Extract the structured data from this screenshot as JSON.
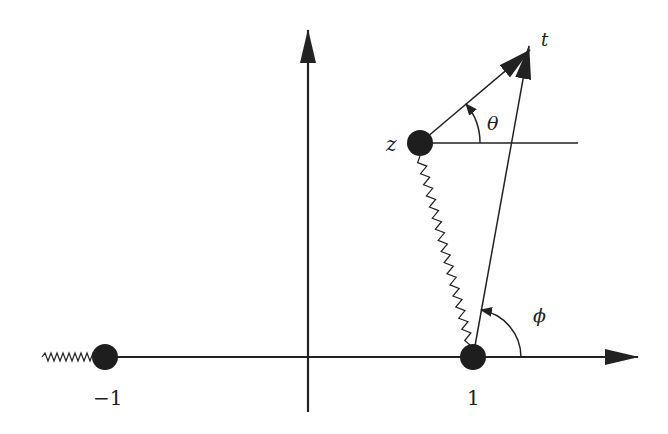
{
  "diagram": {
    "type": "complex-plane-branch-cut",
    "labels": {
      "z": "z",
      "t": "t",
      "theta": "θ",
      "phi": "ϕ",
      "minus_one": "−1",
      "one": "1"
    },
    "points": [
      {
        "name": "z",
        "label": "z"
      },
      {
        "name": "one",
        "label": "1"
      },
      {
        "name": "minus-one",
        "label": "−1"
      }
    ],
    "branch_cuts": [
      {
        "from": "−1",
        "to": "-∞"
      },
      {
        "from": "z",
        "to": "1"
      }
    ],
    "angles": [
      {
        "name": "theta",
        "label": "θ",
        "vertex": "z"
      },
      {
        "name": "phi",
        "label": "ϕ",
        "vertex": "1"
      }
    ],
    "colors": {
      "ink": "#222222",
      "background": "#ffffff"
    }
  }
}
